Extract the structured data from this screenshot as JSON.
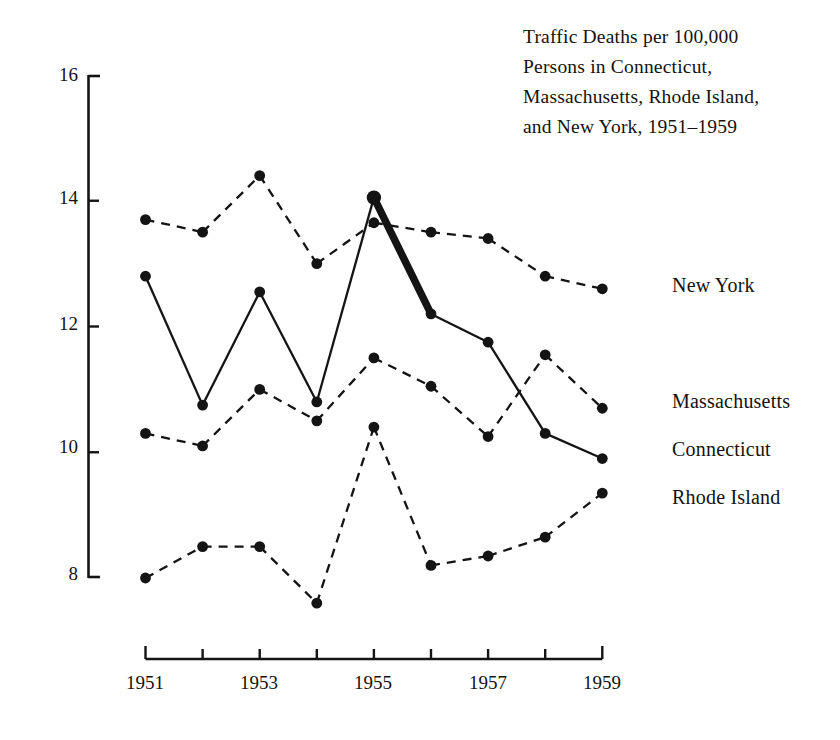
{
  "title": {
    "lines": [
      "Traffic Deaths per 100,000",
      "Persons in Connecticut,",
      "Massachusetts, Rhode Island,",
      "and New York, 1951–1959"
    ]
  },
  "axes": {
    "y_ticks": [
      "16",
      "14",
      "12",
      "10",
      "8"
    ],
    "x_ticks_labeled": [
      "1951",
      "1953",
      "1955",
      "1957",
      "1959"
    ]
  },
  "series_labels": {
    "new_york": "New York",
    "massachusetts": "Massachusetts",
    "connecticut": "Connecticut",
    "rhode_island": "Rhode Island"
  },
  "colors": {
    "ink": "#141414",
    "background": "#ffffff"
  },
  "chart_data": {
    "type": "line",
    "title": "Traffic Deaths per 100,000 Persons in Connecticut, Massachusetts, Rhode Island, and New York, 1951–1959",
    "xlabel": "",
    "ylabel": "Traffic deaths per 100,000 persons",
    "x": [
      1951,
      1952,
      1953,
      1954,
      1955,
      1956,
      1957,
      1958,
      1959
    ],
    "xlim": [
      1951,
      1959
    ],
    "ylim": [
      8,
      16
    ],
    "y_ticks": [
      8,
      10,
      12,
      14,
      16
    ],
    "grid": false,
    "legend": "right-of-plot, labels at final data point",
    "annotation": "The Connecticut 1955–1956 segment is drawn as a heavy bold line to emphasize the drop after the speeding crackdown.",
    "series": [
      {
        "name": "New York",
        "style": "dashed",
        "values": [
          13.7,
          13.5,
          14.4,
          13.0,
          13.65,
          13.5,
          13.4,
          12.8,
          12.6
        ]
      },
      {
        "name": "Massachusetts",
        "style": "dashed",
        "values": [
          10.3,
          10.1,
          11.0,
          10.5,
          11.5,
          11.05,
          10.25,
          11.55,
          10.7
        ]
      },
      {
        "name": "Connecticut",
        "style": "solid",
        "emphasis_segment": [
          1955,
          1956
        ],
        "values": [
          12.8,
          10.75,
          12.55,
          10.8,
          14.05,
          12.2,
          11.75,
          10.3,
          9.9
        ]
      },
      {
        "name": "Rhode Island",
        "style": "dashed",
        "values": [
          8.0,
          8.5,
          8.5,
          7.6,
          10.4,
          8.2,
          8.35,
          8.65,
          9.35
        ]
      }
    ]
  }
}
